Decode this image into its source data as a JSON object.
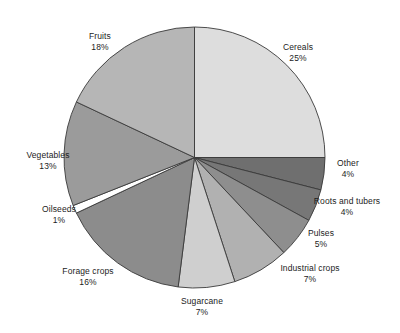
{
  "chart_data": {
    "type": "pie",
    "title": "",
    "subtitle": "",
    "xlabel": "",
    "ylabel": "",
    "legend_position": "none",
    "grid": false,
    "value_unit": "%",
    "start_angle_deg": 0,
    "direction": "clockwise",
    "categories": [
      "Cereals",
      "Other",
      "Roots and tubers",
      "Pulses",
      "Industrial crops",
      "Sugarcane",
      "Forage crops",
      "Oilseeds",
      "Vegetables",
      "Fruits"
    ],
    "values": [
      25,
      4,
      4,
      5,
      7,
      7,
      16,
      1,
      13,
      18
    ],
    "slices": [
      {
        "name": "Cereals",
        "value": 25,
        "value_label": "25%",
        "color": "#dddddd"
      },
      {
        "name": "Other",
        "value": 4,
        "value_label": "4%",
        "color": "#6f6f6f"
      },
      {
        "name": "Roots and tubers",
        "value": 4,
        "value_label": "4%",
        "color": "#777777"
      },
      {
        "name": "Pulses",
        "value": 5,
        "value_label": "5%",
        "color": "#8e8e8e"
      },
      {
        "name": "Industrial crops",
        "value": 7,
        "value_label": "7%",
        "color": "#b1b1b1"
      },
      {
        "name": "Sugarcane",
        "value": 7,
        "value_label": "7%",
        "color": "#cfcfcf"
      },
      {
        "name": "Forage crops",
        "value": 16,
        "value_label": "16%",
        "color": "#8c8c8c"
      },
      {
        "name": "Oilseeds",
        "value": 1,
        "value_label": "1%",
        "color": "#ffffff"
      },
      {
        "name": "Vegetables",
        "value": 13,
        "value_label": "13%",
        "color": "#9b9b9b"
      },
      {
        "name": "Fruits",
        "value": 18,
        "value_label": "18%",
        "color": "#b6b6b6"
      }
    ],
    "stroke_color": "#3a3a3a",
    "background": "#ffffff"
  },
  "labels": {
    "cereals": {
      "name": "Cereals",
      "value": "25%"
    },
    "other": {
      "name": "Other",
      "value": "4%"
    },
    "roots_and_tubers": {
      "name": "Roots and tubers",
      "value": "4%"
    },
    "pulses": {
      "name": "Pulses",
      "value": "5%"
    },
    "industrial_crops": {
      "name": "Industrial crops",
      "value": "7%"
    },
    "sugarcane": {
      "name": "Sugarcane",
      "value": "7%"
    },
    "forage_crops": {
      "name": "Forage crops",
      "value": "16%"
    },
    "oilseeds": {
      "name": "Oilseeds",
      "value": "1%"
    },
    "vegetables": {
      "name": "Vegetables",
      "value": "13%"
    },
    "fruits": {
      "name": "Fruits",
      "value": "18%"
    }
  }
}
